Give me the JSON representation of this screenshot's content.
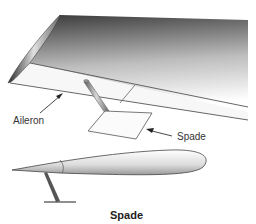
{
  "diagram": {
    "labels": {
      "aileron": "Aileron",
      "spade": "Spade"
    },
    "caption": "Spade",
    "components": [
      "wing",
      "aileron",
      "spade-tab",
      "spade-strut",
      "airfoil-cross-section"
    ],
    "colors": {
      "wing_dark": "#3a3a3a",
      "wing_light": "#ffffff",
      "outline": "#555555",
      "text": "#333333"
    }
  }
}
